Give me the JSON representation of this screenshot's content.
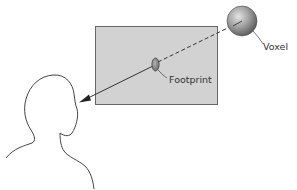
{
  "diagram": {
    "labels": {
      "voxel": "Voxel",
      "footprint": "Footprint"
    },
    "elements": {
      "image_plane": "image-plane",
      "voxel": "voxel-sphere",
      "footprint": "footprint-ellipse",
      "viewer": "viewer-head",
      "ray": "projection-ray"
    },
    "colors": {
      "plane_fill": "#d2d2d2",
      "plane_stroke": "#555555",
      "voxel_light": "#e0e0e0",
      "voxel_dark": "#5a5a5a",
      "footprint_fill": "#8c8c8c",
      "line": "#333333"
    }
  }
}
